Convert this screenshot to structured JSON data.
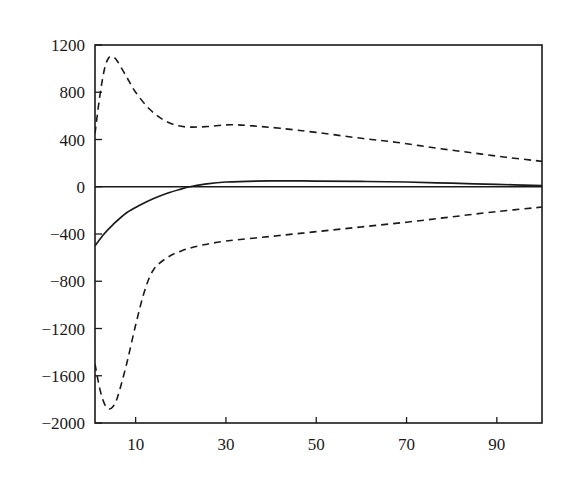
{
  "chart_data": {
    "type": "line",
    "title": "",
    "xlabel": "",
    "ylabel": "",
    "xlim": [
      1,
      100
    ],
    "ylim": [
      -2000,
      1200
    ],
    "grid": false,
    "legend": null,
    "x_ticks": [
      10,
      30,
      50,
      70,
      90
    ],
    "y_ticks": [
      1200,
      800,
      400,
      0,
      -400,
      -800,
      -1200,
      -1600,
      -2000
    ],
    "y_tick_labels": [
      "1200",
      "800",
      "400",
      "0",
      "−400",
      "−800",
      "−1200",
      "−1600",
      "−2000"
    ],
    "x_tick_labels": [
      "10",
      "30",
      "50",
      "70",
      "90"
    ],
    "reference_lines": [
      {
        "orientation": "horizontal",
        "y": 0,
        "style": "solid"
      }
    ],
    "series": [
      {
        "name": "estimate",
        "style": "solid",
        "color": "#1a1a1a",
        "x": [
          1,
          3,
          5,
          8,
          11,
          14,
          17,
          20,
          22,
          25,
          30,
          40,
          50,
          60,
          70,
          80,
          90,
          100
        ],
        "y": [
          -500,
          -400,
          -320,
          -220,
          -155,
          -100,
          -55,
          -20,
          0,
          20,
          40,
          50,
          48,
          45,
          40,
          30,
          20,
          10
        ]
      },
      {
        "name": "upper bound",
        "style": "dashed",
        "color": "#1a1a1a",
        "x": [
          1,
          2,
          3,
          4,
          5,
          6,
          8,
          10,
          13,
          16,
          19,
          22,
          26,
          31,
          36,
          42,
          50,
          60,
          68,
          76,
          84,
          92,
          100
        ],
        "y": [
          450,
          750,
          980,
          1090,
          1100,
          1060,
          930,
          800,
          660,
          570,
          520,
          505,
          510,
          525,
          515,
          495,
          460,
          410,
          375,
          330,
          290,
          250,
          215
        ]
      },
      {
        "name": "lower bound",
        "style": "dashed",
        "color": "#1a1a1a",
        "x": [
          1,
          2,
          3,
          4,
          5,
          6,
          8,
          10,
          12,
          14,
          17,
          20,
          24,
          30,
          40,
          50,
          60,
          70,
          80,
          90,
          100
        ],
        "y": [
          -1500,
          -1700,
          -1830,
          -1880,
          -1860,
          -1780,
          -1500,
          -1170,
          -880,
          -700,
          -600,
          -545,
          -500,
          -460,
          -420,
          -380,
          -340,
          -300,
          -255,
          -210,
          -172
        ]
      }
    ]
  }
}
